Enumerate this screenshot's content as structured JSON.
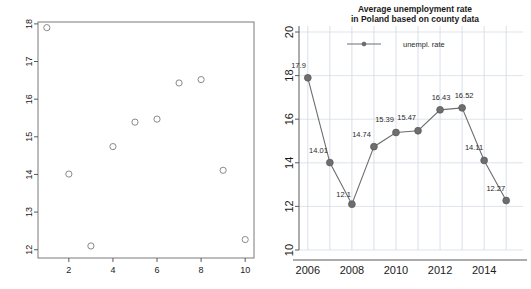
{
  "figure": {
    "background": "#ffffff",
    "marker_color": "#6e6e6e",
    "line_color": "#6e6e6e",
    "grid_color": "#cfd8e3",
    "axis_color": "#5a5a5a"
  },
  "chart_data": [
    {
      "id": "left-scatter",
      "type": "scatter",
      "title": "",
      "xlabel": "",
      "ylabel": "",
      "x": [
        1,
        2,
        3,
        4,
        5,
        6,
        7,
        8,
        9,
        10
      ],
      "values": [
        17.9,
        14.01,
        12.1,
        14.74,
        15.39,
        15.47,
        16.43,
        16.52,
        14.11,
        12.27
      ],
      "xlim": [
        0.6,
        10.4
      ],
      "ylim": [
        11.78,
        18.05
      ],
      "xticks": [
        2,
        4,
        6,
        8,
        10
      ],
      "xticklabels": [
        "2",
        "4",
        "6",
        "8",
        "10"
      ],
      "yticks": [
        12,
        13,
        14,
        15,
        16,
        17,
        18
      ],
      "yticklabels": [
        "12",
        "13",
        "14",
        "15",
        "16",
        "17",
        "18"
      ],
      "grid": false,
      "legend": null,
      "marker_style": "open-circle"
    },
    {
      "id": "right-line",
      "type": "line",
      "title": "Average unemployment rate\nin Poland based on county data",
      "title_line1": "Average unemployment rate",
      "title_line2": "in Poland based on county data",
      "xlabel": "",
      "ylabel": "",
      "x": [
        2006,
        2007,
        2008,
        2009,
        2010,
        2011,
        2012,
        2013,
        2014,
        2015
      ],
      "values": [
        17.9,
        14.01,
        12.1,
        14.74,
        15.39,
        15.47,
        16.43,
        16.52,
        14.11,
        12.27
      ],
      "point_labels": [
        "17.9",
        "14.01",
        "12.1",
        "14.74",
        "15.39",
        "15.47",
        "16.43",
        "16.52",
        "14.11",
        "12.27"
      ],
      "xlim": [
        2005.6,
        2015.4
      ],
      "ylim": [
        10,
        20
      ],
      "xticks": [
        2006,
        2008,
        2010,
        2012,
        2014
      ],
      "xticklabels": [
        "2006",
        "2008",
        "2010",
        "2012",
        "2014"
      ],
      "yticks": [
        10,
        12,
        14,
        16,
        18,
        20
      ],
      "yticklabels": [
        "10",
        "12",
        "14",
        "16",
        "18",
        "20"
      ],
      "grid": true,
      "legend": {
        "entries": [
          "unempl. rate"
        ],
        "position": "top-center"
      },
      "marker_style": "filled-circle"
    }
  ]
}
